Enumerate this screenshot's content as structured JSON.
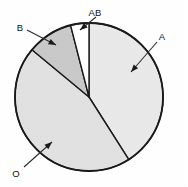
{
  "chart_data": {
    "type": "pie",
    "title": "",
    "xlabel": "",
    "ylabel": "",
    "legend_position": "callout-labels",
    "grid": false,
    "center": {
      "x": 89,
      "y": 97
    },
    "radius": 74,
    "start_angle_deg": -90,
    "direction": "clockwise",
    "categories": [
      "A",
      "O",
      "B",
      "AB"
    ],
    "values": [
      41,
      45,
      10,
      4
    ],
    "slices": [
      {
        "label": "A",
        "value": 41,
        "color": "#e9e9e9",
        "start_deg": -90,
        "end_deg": 57.6,
        "label_x": 162,
        "label_y": 37,
        "leader_x1": 157,
        "leader_y1": 42,
        "leader_x2": 131,
        "leader_y2": 72
      },
      {
        "label": "O",
        "value": 45,
        "color": "#e1e1e1",
        "start_deg": 57.6,
        "end_deg": 219.6,
        "label_x": 16,
        "label_y": 174,
        "leader_x1": 24,
        "leader_y1": 167,
        "leader_x2": 52,
        "leader_y2": 142
      },
      {
        "label": "B",
        "value": 10,
        "color": "#c9c9c9",
        "start_deg": 219.6,
        "end_deg": 255.6,
        "label_x": 20,
        "label_y": 28,
        "leader_x1": 27,
        "leader_y1": 30,
        "leader_x2": 56,
        "leader_y2": 45
      },
      {
        "label": "AB",
        "value": 4,
        "color": "#ffffff",
        "start_deg": 255.6,
        "end_deg": 270,
        "label_x": 95,
        "label_y": 13,
        "leader_x1": 96,
        "leader_y1": 17,
        "leader_x2": 80,
        "leader_y2": 30
      }
    ],
    "total": 100,
    "units": "percent",
    "outline_color": "#1a1a1a",
    "background_color": "#ffffff"
  }
}
